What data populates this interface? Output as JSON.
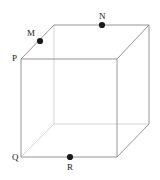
{
  "figure": {
    "kind": "cube-diagram",
    "width": 160,
    "height": 180,
    "background_color": "#ffffff",
    "visible_edge_color": "#8a8a8a",
    "hidden_edge_color": "#cfcfcf",
    "point_color": "#1a1a1a",
    "label_color": "#1a1a1a",
    "edge_stroke_width": 0.9,
    "point_radius": 3.1,
    "vertices": {
      "front_top_left": {
        "x": 21,
        "y": 59,
        "label": "P"
      },
      "front_top_right": {
        "x": 117,
        "y": 59,
        "label": ""
      },
      "front_bottom_right": {
        "x": 117,
        "y": 157,
        "label": ""
      },
      "front_bottom_left": {
        "x": 21,
        "y": 157,
        "label": "Q"
      },
      "back_top_left": {
        "x": 54,
        "y": 25,
        "label": ""
      },
      "back_top_right": {
        "x": 149,
        "y": 25,
        "label": ""
      },
      "back_bottom_right": {
        "x": 149,
        "y": 124,
        "label": ""
      },
      "back_bottom_left": {
        "x": 54,
        "y": 124,
        "label": ""
      }
    },
    "marked_points": [
      {
        "id": "M",
        "label": "M",
        "x": 40,
        "y": 41,
        "label_x": 27,
        "label_y": 29,
        "on_edge": "front_top_left-to-back_top_left"
      },
      {
        "id": "N",
        "label": "N",
        "x": 102,
        "y": 25,
        "label_x": 99,
        "label_y": 12,
        "on_edge": "back_top_left-to-back_top_right"
      },
      {
        "id": "R",
        "label": "R",
        "x": 70,
        "y": 157,
        "label_x": 67,
        "label_y": 163,
        "on_edge": "front_bottom_left-to-front_bottom_right"
      }
    ],
    "corner_labels": [
      {
        "id": "P",
        "label": "P",
        "label_x": 12,
        "label_y": 54
      },
      {
        "id": "Q",
        "label": "Q",
        "label_x": 12,
        "label_y": 153
      }
    ]
  }
}
